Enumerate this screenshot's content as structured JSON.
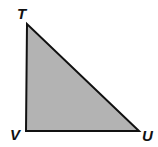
{
  "diagram": {
    "type": "right-triangle",
    "vertices": [
      {
        "id": "T",
        "label": "T"
      },
      {
        "id": "V",
        "label": "V"
      },
      {
        "id": "U",
        "label": "U"
      }
    ],
    "right_angle_at": "V",
    "fill_color": "#b3b3b3",
    "stroke_color": "#111111"
  }
}
